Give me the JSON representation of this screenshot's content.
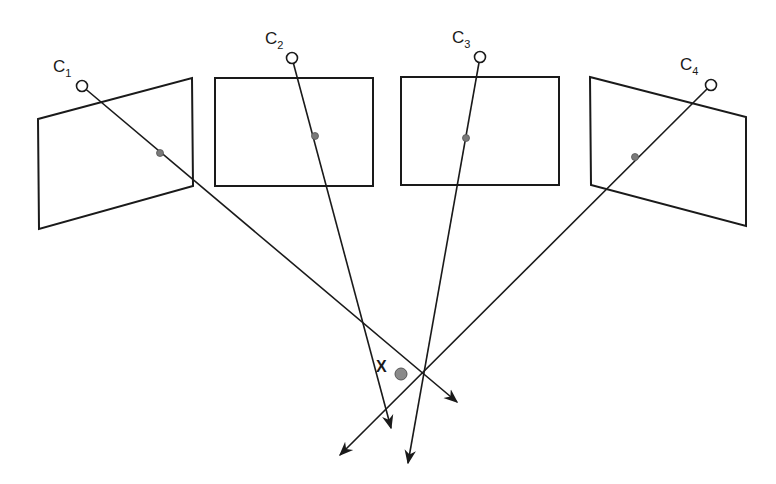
{
  "diagram": {
    "title": "",
    "colors": {
      "stroke": "#1a1a1a",
      "projection_point": "#7a7a7a",
      "point_x": "#8a8a8a"
    },
    "cameras": [
      {
        "label": "C",
        "subscript": "1",
        "center": [
          82,
          86
        ],
        "label_pos": [
          53,
          72
        ],
        "image_plane": [
          [
            38,
            119
          ],
          [
            192,
            78
          ],
          [
            193,
            186
          ],
          [
            39,
            229
          ]
        ],
        "projection": [
          160,
          153
        ],
        "ray_end": [
          457,
          402
        ]
      },
      {
        "label": "C",
        "subscript": "2",
        "center": [
          292,
          58
        ],
        "label_pos": [
          265,
          44
        ],
        "image_plane": [
          [
            215,
            78
          ],
          [
            373,
            78
          ],
          [
            373,
            186
          ],
          [
            215,
            186
          ]
        ],
        "projection": [
          315,
          136
        ],
        "ray_end": [
          391,
          428
        ]
      },
      {
        "label": "C",
        "subscript": "3",
        "center": [
          480,
          57
        ],
        "label_pos": [
          452,
          43
        ],
        "image_plane": [
          [
            401,
            77
          ],
          [
            559,
            77
          ],
          [
            559,
            185
          ],
          [
            401,
            185
          ]
        ],
        "projection": [
          466,
          138
        ],
        "ray_end": [
          408,
          463
        ]
      },
      {
        "label": "C",
        "subscript": "4",
        "center": [
          711,
          85
        ],
        "label_pos": [
          680,
          70
        ],
        "image_plane": [
          [
            590,
            77
          ],
          [
            746,
            117
          ],
          [
            746,
            226
          ],
          [
            591,
            185
          ]
        ],
        "projection": [
          635,
          157
        ],
        "ray_end": [
          340,
          455
        ]
      }
    ],
    "point": {
      "label": "X",
      "position": [
        401,
        374
      ],
      "label_pos": [
        376,
        372
      ]
    }
  }
}
